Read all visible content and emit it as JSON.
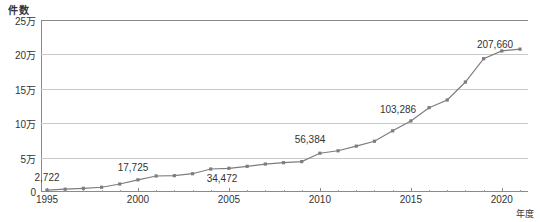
{
  "chart_data": {
    "type": "line",
    "title": "",
    "xlabel": "年度",
    "ylabel": "件数",
    "grid": true,
    "legend": false,
    "xlim": [
      1995,
      2021
    ],
    "ylim": [
      0,
      250000
    ],
    "x_tick_labels": [
      "1995",
      "2000",
      "2005",
      "2010",
      "2015",
      "2020"
    ],
    "x_tick_values": [
      1995,
      2000,
      2005,
      2010,
      2015,
      2020
    ],
    "y_tick_labels": [
      "0",
      "5万",
      "10万",
      "15万",
      "20万",
      "25万"
    ],
    "y_tick_values": [
      0,
      50000,
      100000,
      150000,
      200000,
      250000
    ],
    "series": [
      {
        "name": "件数",
        "color": "#7d7d7d",
        "marker": "square",
        "x": [
          1995,
          1996,
          1997,
          1998,
          1999,
          2000,
          2001,
          2002,
          2003,
          2004,
          2005,
          2006,
          2007,
          2008,
          2009,
          2010,
          2011,
          2012,
          2013,
          2014,
          2015,
          2016,
          2017,
          2018,
          2019,
          2020,
          2021
        ],
        "values": [
          2722,
          4102,
          5352,
          6932,
          11631,
          17725,
          23274,
          23738,
          26569,
          33408,
          34472,
          37323,
          40639,
          42664,
          44211,
          56384,
          59919,
          66701,
          73802,
          88931,
          103286,
          122575,
          133778,
          159838,
          193780,
          205044,
          207660
        ]
      }
    ],
    "point_labels": [
      {
        "x": 1995,
        "value": 2722,
        "text": "2,722",
        "px": 47,
        "py": 183
      },
      {
        "x": 2000,
        "value": 17725,
        "text": "17,725",
        "px": 133,
        "py": 173
      },
      {
        "x": 2005,
        "value": 34472,
        "text": "34,472",
        "px": 222,
        "py": 184
      },
      {
        "x": 2010,
        "value": 56384,
        "text": "56,384",
        "px": 310,
        "py": 145
      },
      {
        "x": 2015,
        "value": 103286,
        "text": "103,286",
        "px": 398,
        "py": 115
      },
      {
        "x": 2021,
        "value": 207660,
        "text": "207,660",
        "px": 495,
        "py": 50
      }
    ]
  }
}
